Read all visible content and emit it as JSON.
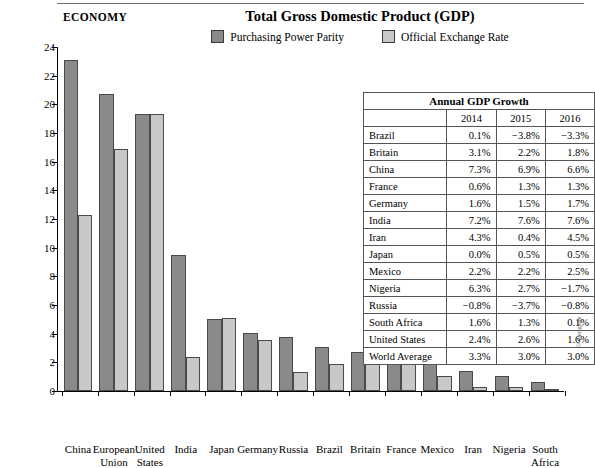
{
  "header": {
    "section_label": "ECONOMY",
    "title": "Total Gross Domestic Product (GDP)",
    "credit": "© Cengage"
  },
  "legend": [
    {
      "label": "Purchasing Power Parity",
      "color": "#8a8a8a"
    },
    {
      "label": "Official Exchange Rate",
      "color": "#c8c8c8"
    }
  ],
  "chart_data": {
    "type": "bar",
    "title": "Total Gross Domestic Product (GDP)",
    "xlabel": "",
    "ylabel": "US$ (trillions)",
    "ylim": [
      0,
      24
    ],
    "yticks": [
      0,
      2,
      4,
      6,
      8,
      10,
      12,
      14,
      16,
      18,
      20,
      22,
      24
    ],
    "grid": false,
    "legend_position": "top-center",
    "categories": [
      "China",
      "European\nUnion",
      "United\nStates",
      "India",
      "Japan",
      "Germany",
      "Russia",
      "Brazil",
      "Britain",
      "France",
      "Mexico",
      "Iran",
      "Nigeria",
      "South\nAfrica"
    ],
    "series": [
      {
        "name": "Purchasing Power Parity",
        "color": "#8a8a8a",
        "values": [
          23.1,
          20.7,
          19.3,
          9.5,
          5.0,
          4.05,
          3.75,
          3.1,
          2.75,
          2.7,
          2.25,
          1.4,
          1.05,
          0.65
        ]
      },
      {
        "name": "Official Exchange Rate",
        "color": "#c8c8c8",
        "values": [
          12.3,
          16.9,
          19.3,
          2.4,
          5.1,
          3.55,
          1.3,
          1.85,
          2.55,
          2.4,
          1.05,
          0.3,
          0.3,
          0.15
        ]
      }
    ]
  },
  "table": {
    "caption": "Annual GDP Growth",
    "columns": [
      "",
      "2014",
      "2015",
      "2016"
    ],
    "rows": [
      {
        "country": "Brazil",
        "v2014": "0.1%",
        "v2015": "−3.8%",
        "v2016": "−3.3%"
      },
      {
        "country": "Britain",
        "v2014": "3.1%",
        "v2015": "2.2%",
        "v2016": "1.8%"
      },
      {
        "country": "China",
        "v2014": "7.3%",
        "v2015": "6.9%",
        "v2016": "6.6%"
      },
      {
        "country": "France",
        "v2014": "0.6%",
        "v2015": "1.3%",
        "v2016": "1.3%"
      },
      {
        "country": "Germany",
        "v2014": "1.6%",
        "v2015": "1.5%",
        "v2016": "1.7%"
      },
      {
        "country": "India",
        "v2014": "7.2%",
        "v2015": "7.6%",
        "v2016": "7.6%"
      },
      {
        "country": "Iran",
        "v2014": "4.3%",
        "v2015": "0.4%",
        "v2016": "4.5%"
      },
      {
        "country": "Japan",
        "v2014": "0.0%",
        "v2015": "0.5%",
        "v2016": "0.5%"
      },
      {
        "country": "Mexico",
        "v2014": "2.2%",
        "v2015": "2.2%",
        "v2016": "2.5%"
      },
      {
        "country": "Nigeria",
        "v2014": "6.3%",
        "v2015": "2.7%",
        "v2016": "−1.7%"
      },
      {
        "country": "Russia",
        "v2014": "−0.8%",
        "v2015": "−3.7%",
        "v2016": "−0.8%"
      },
      {
        "country": "South Africa",
        "v2014": "1.6%",
        "v2015": "1.3%",
        "v2016": "0.1%"
      },
      {
        "country": "United States",
        "v2014": "2.4%",
        "v2015": "2.6%",
        "v2016": "1.6%"
      },
      {
        "country": "World Average",
        "v2014": "3.3%",
        "v2015": "3.0%",
        "v2016": "3.0%"
      }
    ]
  }
}
